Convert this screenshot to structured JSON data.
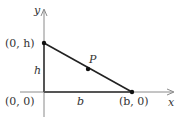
{
  "diagram": {
    "axes": {
      "x_label": "x",
      "y_label": "y"
    },
    "points": {
      "origin": "(0, 0)",
      "top": "(0, h)",
      "right": "(b, 0)",
      "p": "P"
    },
    "sides": {
      "height": "h",
      "base": "b"
    },
    "colors": {
      "axis": "#888888",
      "line": "#222222",
      "leg": "#555555"
    }
  }
}
